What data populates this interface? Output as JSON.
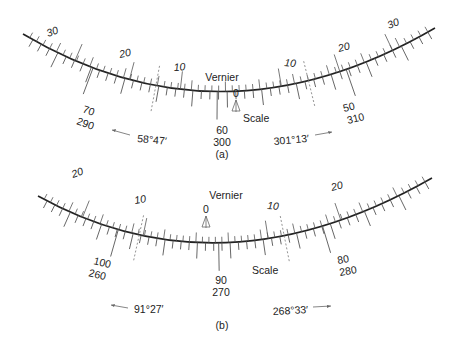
{
  "panels": [
    {
      "id": "a",
      "caption": "(a)",
      "vernier_label": "Vernier",
      "scale_label": "Scale",
      "vernier_zero": "0",
      "curve": {
        "x0": 23,
        "y0": 34,
        "cx": 222,
        "cy": 152,
        "x1": 435,
        "y1": 28
      },
      "vernier_numbers": [
        {
          "text": "30",
          "t": 0.13
        },
        {
          "text": "20",
          "t": 0.265
        },
        {
          "text": "10",
          "t": 0.39
        },
        {
          "text": "10",
          "t": 0.635
        },
        {
          "text": "20",
          "t": 0.775
        },
        {
          "text": "30",
          "t": 0.9
        }
      ],
      "scale_labels": [
        {
          "line1": "70",
          "line2": "290",
          "t": 0.175
        },
        {
          "line1": "60",
          "line2": "300",
          "t": 0.48
        },
        {
          "line1": "50",
          "line2": "310",
          "t": 0.79
        }
      ],
      "readings": [
        {
          "text": "58°47′",
          "direction": "left"
        },
        {
          "text": "301°13′",
          "direction": "right"
        }
      ]
    },
    {
      "id": "b",
      "caption": "(b)",
      "vernier_label": "Vernier",
      "scale_label": "Scale",
      "vernier_zero": "0",
      "curve": {
        "x0": 38,
        "y0": 196,
        "cx": 222,
        "cy": 298,
        "x1": 432,
        "y1": 178
      },
      "vernier_numbers": [
        {
          "text": "20",
          "t": 0.12
        },
        {
          "text": "10",
          "t": 0.28
        },
        {
          "text": "10",
          "t": 0.6
        },
        {
          "text": "20",
          "t": 0.78
        }
      ],
      "scale_labels": [
        {
          "line1": "100",
          "line2": "260",
          "t": 0.215
        },
        {
          "line1": "90",
          "line2": "270",
          "t": 0.475
        },
        {
          "line1": "80",
          "line2": "280",
          "t": 0.735
        }
      ],
      "readings": [
        {
          "text": "91°27′",
          "direction": "left"
        },
        {
          "text": "268°33′",
          "direction": "right"
        }
      ]
    }
  ]
}
